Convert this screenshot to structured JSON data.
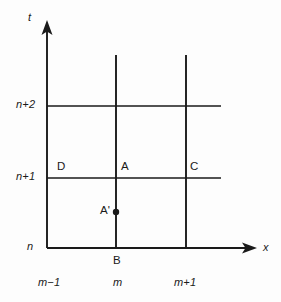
{
  "figure": {
    "type": "spacetime-lattice-diagram",
    "background_color": "#fdfdfd",
    "line_color": "#1a1a1a",
    "text_color": "#1a1a1a"
  },
  "axes": {
    "vertical": {
      "label": "t",
      "x": 47,
      "y_top": 22,
      "y_bottom": 248
    },
    "horizontal": {
      "label": "x",
      "y": 248,
      "x_left": 47,
      "x_right": 255
    }
  },
  "y_ticks": [
    {
      "label": "n+2",
      "y": 106
    },
    {
      "label": "n+1",
      "y": 178
    },
    {
      "label": "n",
      "y": 248
    }
  ],
  "x_ticks": [
    {
      "label": "m−1",
      "x": 47
    },
    {
      "label": "m",
      "x": 116
    },
    {
      "label": "m+1",
      "x": 186
    }
  ],
  "grid_lines": {
    "vertical": [
      {
        "x": 116,
        "y_top": 55,
        "y_bottom": 248
      },
      {
        "x": 186,
        "y_top": 55,
        "y_bottom": 248
      }
    ],
    "horizontal": [
      {
        "y": 106,
        "x_left": 47,
        "x_right": 221
      },
      {
        "y": 178,
        "x_left": 47,
        "x_right": 221
      }
    ]
  },
  "points": [
    {
      "name": "D",
      "label": "D",
      "label_x": 57,
      "label_y": 162,
      "marker": false
    },
    {
      "name": "A",
      "label": "A",
      "label_x": 120,
      "label_y": 162,
      "marker": false
    },
    {
      "name": "C",
      "label": "C",
      "label_x": 190,
      "label_y": 162,
      "marker": false
    },
    {
      "name": "A-prime",
      "label": "A'",
      "label_x": 101,
      "label_y": 206,
      "marker": true,
      "marker_x": 116,
      "marker_y": 212,
      "marker_r": 3.2
    },
    {
      "name": "B",
      "label": "B",
      "label_x": 113,
      "label_y": 256,
      "marker": false
    }
  ],
  "labels": {
    "t_axis": "t",
    "x_axis": "x",
    "n": "n",
    "n_plus_1": "n+1",
    "n_plus_2": "n+2",
    "m_minus_1": "m−1",
    "m": "m",
    "m_plus_1": "m+1",
    "point_a": "A",
    "point_b": "B",
    "point_c": "C",
    "point_d": "D",
    "point_a_prime": "A'"
  }
}
